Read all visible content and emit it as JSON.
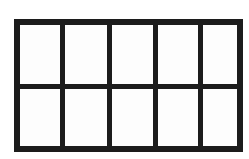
{
  "figure": {
    "shape": "rectangle-grid",
    "rows": 2,
    "columns": 5,
    "cell_count": 10,
    "geometry": {
      "left": 14,
      "top": 19,
      "width": 229,
      "height": 133,
      "outer_stroke_px": 6,
      "inner_stroke_px": 5,
      "column_divider_x": [
        60,
        107,
        153,
        198
      ],
      "row_divider_y": [
        84
      ]
    },
    "colors": {
      "stroke": "#1c1c1c",
      "cell_fill": "#fdfdfd",
      "background": "#ffffff"
    },
    "cells": [
      {
        "row": 1,
        "col": 1,
        "label": ""
      },
      {
        "row": 1,
        "col": 2,
        "label": ""
      },
      {
        "row": 1,
        "col": 3,
        "label": ""
      },
      {
        "row": 1,
        "col": 4,
        "label": ""
      },
      {
        "row": 1,
        "col": 5,
        "label": ""
      },
      {
        "row": 2,
        "col": 1,
        "label": ""
      },
      {
        "row": 2,
        "col": 2,
        "label": ""
      },
      {
        "row": 2,
        "col": 3,
        "label": ""
      },
      {
        "row": 2,
        "col": 4,
        "label": ""
      },
      {
        "row": 2,
        "col": 5,
        "label": ""
      }
    ]
  }
}
